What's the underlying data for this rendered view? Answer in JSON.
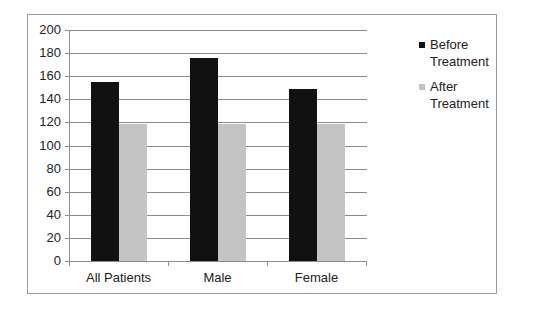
{
  "chart_data": {
    "type": "bar",
    "title": "",
    "xlabel": "",
    "ylabel": "",
    "categories": [
      "All Patients",
      "Male",
      "Female"
    ],
    "series": [
      {
        "name": "Before Treatment",
        "color": "#111111",
        "values": [
          155,
          176,
          149
        ]
      },
      {
        "name": "After Treatment",
        "color": "#c4c4c4",
        "values": [
          119,
          119,
          119
        ]
      }
    ],
    "ylim": [
      0,
      200
    ],
    "yticks": [
      0,
      20,
      40,
      60,
      80,
      100,
      120,
      140,
      160,
      180,
      200
    ],
    "grid": true,
    "legend_position": "right"
  },
  "legend": {
    "before_line1": "Before",
    "before_line2": "Treatment",
    "after_line1": "After",
    "after_line2": "Treatment"
  },
  "axis": {
    "y_labels": [
      "0",
      "20",
      "40",
      "60",
      "80",
      "100",
      "120",
      "140",
      "160",
      "180",
      "200"
    ],
    "x_labels": [
      "All Patients",
      "Male",
      "Female"
    ]
  }
}
